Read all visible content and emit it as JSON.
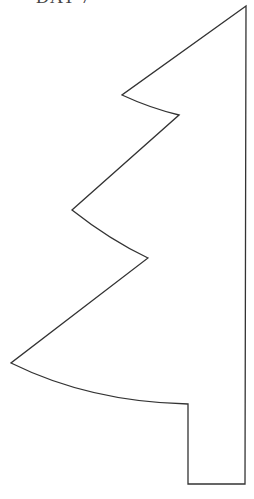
{
  "page": {
    "title": "DAY 7"
  },
  "shape": {
    "name": "tree-outline",
    "stroke_color": "#333333",
    "fill_color": "#ffffff"
  }
}
